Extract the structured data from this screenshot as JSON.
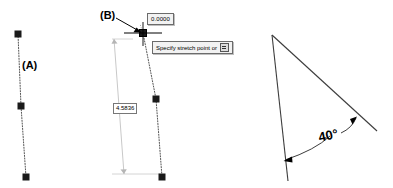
{
  "app": {
    "context": "cad-stretch-grip-editing-figure",
    "background_color": "#ffffff",
    "line_color": "#000000",
    "dim_line_color": "#b9b9b9",
    "tooltip_bg": "#f2f2f2",
    "tooltip_border": "#6b6b6b"
  },
  "annotations": {
    "label_a": "(A)",
    "label_b": "(B)"
  },
  "dynamic_input": {
    "value_field": "0.0000",
    "prompt_text": "Specify stretch point or",
    "prompt_dropdown_icon": "dropdown-options-icon"
  },
  "dimensions": {
    "length_value": "4.5836",
    "angle_value": "40°"
  },
  "objects": {
    "left_line": {
      "name": "polyline-A",
      "style": "dotted",
      "grips": [
        {
          "x": 18,
          "y": 34
        },
        {
          "x": 21,
          "y": 106
        },
        {
          "x": 26,
          "y": 177
        }
      ]
    },
    "middle_line": {
      "name": "polyline-B-stretching",
      "style": "dotted",
      "grips": [
        {
          "x": 143,
          "y": 33
        },
        {
          "x": 156,
          "y": 99
        },
        {
          "x": 162,
          "y": 177
        }
      ]
    },
    "angle_figure": {
      "name": "angle-dimension-figure",
      "apex": {
        "x": 272,
        "y": 35
      },
      "leg1_end": {
        "x": 288,
        "y": 181
      },
      "leg2_end": {
        "x": 377,
        "y": 131
      }
    }
  },
  "cursor": {
    "name": "crosshair-pickbox-cursor",
    "x": 143,
    "y": 33
  }
}
